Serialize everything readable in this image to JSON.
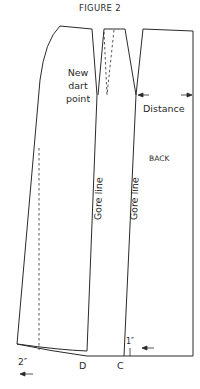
{
  "figure": {
    "title": "FIGURE 2",
    "labels": {
      "new_dart_point": "New dart point",
      "distance": "Distance",
      "back": "BACK",
      "gore_line_1": "Gore line",
      "gore_line_2": "Gore line",
      "measure_2in": "2″",
      "point_d": "D",
      "point_c": "C",
      "measure_1in": "1″"
    },
    "colors": {
      "line": "#2a2a2a",
      "background": "#ffffff"
    }
  }
}
